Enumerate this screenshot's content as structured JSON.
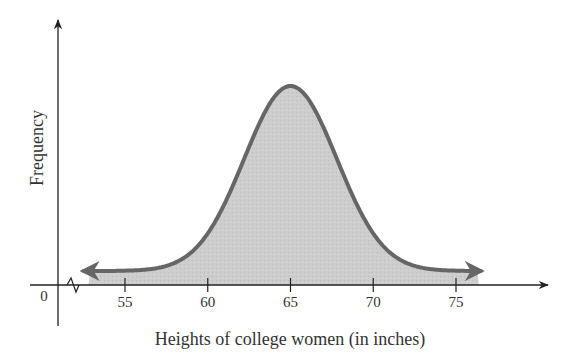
{
  "chart_data": {
    "type": "area",
    "title": "",
    "xlabel": "Heights of college women (in inches)",
    "ylabel": "Frequency",
    "origin_label": "0",
    "x_ticks": [
      55,
      60,
      65,
      70,
      75
    ],
    "x_tick_labels": [
      "55",
      "60",
      "65",
      "70",
      "75"
    ],
    "xlim": [
      52.5,
      78
    ],
    "axis_break": true,
    "distribution": {
      "kind": "normal",
      "mean": 65,
      "sd": 2.8
    },
    "curve_range": [
      52.5,
      76.5
    ],
    "series": [
      {
        "name": "Heights of college women",
        "description": "Bell-shaped (normal) curve peaking at 65 inches, with arrows on both tails"
      }
    ],
    "grid": false,
    "legend": "none",
    "colors": {
      "fill": "#c8c8c8",
      "curve": "#666666",
      "axis": "#222222"
    }
  }
}
